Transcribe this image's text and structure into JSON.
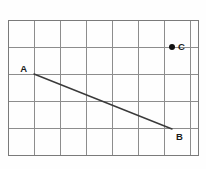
{
  "figure": {
    "background_color": "#fefefe",
    "grid": {
      "line_color": "#8d8d8d",
      "border_color": "#7a7a7a",
      "origin_x": 8,
      "origin_y": 20,
      "cell_width": 26,
      "cell_height": 27,
      "columns": 7,
      "rows": 5,
      "right_edge_x": 198,
      "bottom_edge_y": 155,
      "x_lines": [
        8,
        34,
        60,
        86,
        112,
        138,
        164,
        190,
        198
      ],
      "y_lines": [
        20,
        47,
        74,
        101,
        128,
        155
      ]
    },
    "segment": {
      "name": "segment-AB",
      "color": "#3a3a3a",
      "x1": 34,
      "y1": 74,
      "x2": 172,
      "y2": 129
    },
    "points": [
      {
        "id": "A",
        "label": "A",
        "x": 34,
        "y": 74,
        "dot": false,
        "label_x": 27,
        "label_y": 72,
        "label_anchor": "end"
      },
      {
        "id": "B",
        "label": "B",
        "x": 172,
        "y": 129,
        "dot": false,
        "label_x": 176,
        "label_y": 140,
        "label_anchor": "start"
      },
      {
        "id": "C",
        "label": "C",
        "x": 172,
        "y": 47,
        "dot": true,
        "dot_radius": 3,
        "dot_color": "#111111",
        "label_x": 178,
        "label_y": 50,
        "label_anchor": "start"
      }
    ]
  }
}
